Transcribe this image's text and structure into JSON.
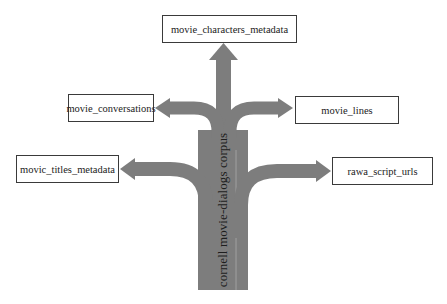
{
  "diagram": {
    "type": "tree-arrows",
    "root": {
      "label": "cornell movie-dialogs corpus",
      "orientation": "vertical"
    },
    "nodes": [
      {
        "id": "characters",
        "label": "movie_characters_metadata",
        "position": "top"
      },
      {
        "id": "conversations",
        "label": "movie_conversations",
        "position": "upper-left"
      },
      {
        "id": "lines",
        "label": "movie_lines",
        "position": "upper-right"
      },
      {
        "id": "titles",
        "label": "movic_titles_metadata",
        "position": "lower-left"
      },
      {
        "id": "scripts",
        "label": "rawa_script_urls",
        "position": "lower-right"
      }
    ],
    "edges": [
      {
        "from": "root",
        "to": "characters"
      },
      {
        "from": "root",
        "to": "conversations"
      },
      {
        "from": "root",
        "to": "lines"
      },
      {
        "from": "root",
        "to": "titles"
      },
      {
        "from": "root",
        "to": "scripts"
      }
    ],
    "colors": {
      "arrow": "#7d7d7d",
      "box_border": "#3a3a3a",
      "text": "#222222",
      "background": "#ffffff"
    }
  }
}
